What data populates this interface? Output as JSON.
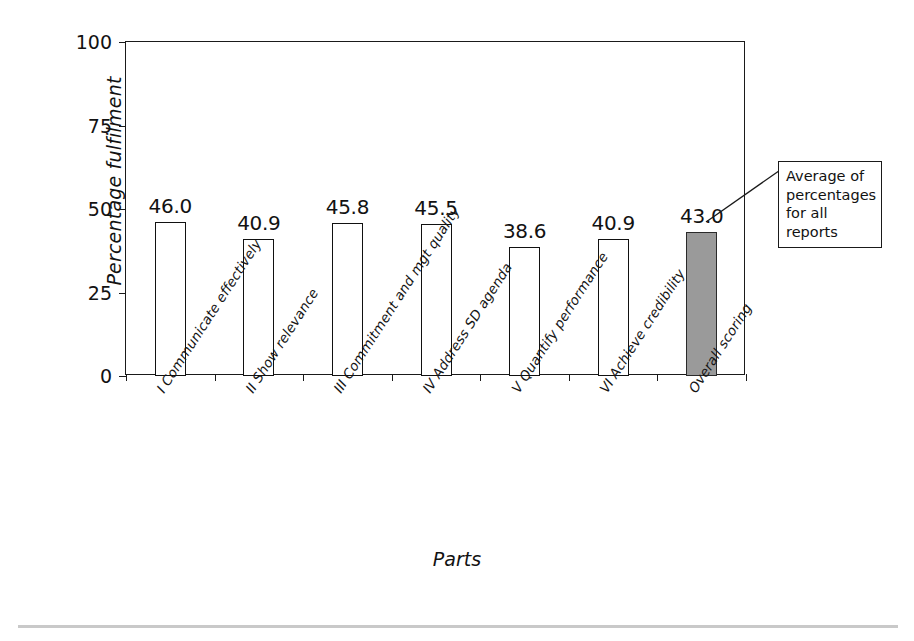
{
  "chart_data": {
    "type": "bar",
    "title": "",
    "xlabel": "Parts",
    "ylabel": "Percentage fulfilment",
    "ylim": [
      0,
      100
    ],
    "yticks": [
      0,
      25,
      50,
      75,
      100
    ],
    "ytick_labels": [
      "0",
      "25",
      "50",
      "75",
      "100"
    ],
    "grid": false,
    "legend": "none",
    "categories": [
      "I Communicate effectively",
      "II Show relevance",
      "III Commitment and mgt quality",
      "IV Address SD agenda",
      "V Quantify performance",
      "VI Achieve credibility",
      "Overall scoring"
    ],
    "values": [
      46.0,
      40.9,
      45.8,
      45.5,
      38.6,
      40.9,
      43.0
    ],
    "value_labels": [
      "46.0",
      "40.9",
      "45.8",
      "45.5",
      "38.6",
      "40.9",
      "43.0"
    ],
    "bar_styles": [
      "outline",
      "outline",
      "outline",
      "outline",
      "outline",
      "outline",
      "shaded"
    ],
    "colors": {
      "bar_fill": "#ffffff",
      "bar_outline": "#111111",
      "highlight_fill": "#9a9a9a",
      "axis": "#1a1a1a",
      "text": "#121212",
      "rule": "#c9c9c9"
    },
    "annotations": [
      {
        "text": "Average of percentages for all reports",
        "lines": [
          "Average of",
          "percentages",
          "for all",
          "reports"
        ],
        "points_to_category": "Overall scoring"
      }
    ]
  }
}
